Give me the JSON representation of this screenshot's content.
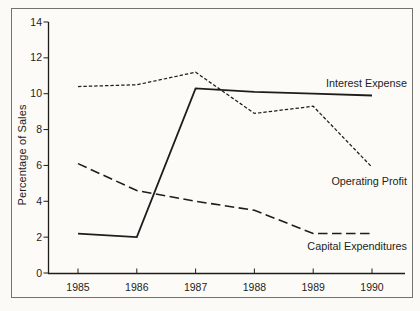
{
  "chart_data": {
    "type": "line",
    "title": "",
    "xlabel": "",
    "ylabel": "Percentage of Sales",
    "x": [
      1985,
      1986,
      1987,
      1988,
      1989,
      1990
    ],
    "ylim": [
      0,
      14
    ],
    "yticks": [
      0,
      2,
      4,
      6,
      8,
      10,
      12,
      14
    ],
    "grid": false,
    "legend": "direct line labels inside plot, right side",
    "line_color": "#1d1d1b",
    "series": [
      {
        "name": "Operating Profit",
        "style": "short-dash",
        "values": [
          10.4,
          10.5,
          11.2,
          8.9,
          9.3,
          5.9
        ]
      },
      {
        "name": "Interest Expense",
        "style": "solid",
        "values": [
          2.2,
          2.0,
          10.3,
          10.1,
          10.0,
          9.9
        ]
      },
      {
        "name": "Capital Expenditures",
        "style": "long-dash",
        "values": [
          6.1,
          4.6,
          4.0,
          3.5,
          2.2,
          2.2
        ]
      }
    ]
  }
}
